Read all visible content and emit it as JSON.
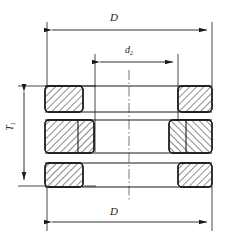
{
  "drawing": {
    "title": "Thrust bearing cross-section",
    "type": "engineering-cross-section",
    "background": "#ffffff",
    "line_color": "#1a1a1a",
    "hatch_color": "#2b2b2b"
  },
  "labels": {
    "outer_diameter_top": "D",
    "outer_diameter_bottom": "D",
    "inner_diameter": "d",
    "inner_diameter_sub": "2",
    "total_height": "T",
    "total_height_sub": "1"
  },
  "dimensions": [
    {
      "name": "D-top",
      "label": "D",
      "orientation": "horizontal",
      "x1": 47,
      "x2": 212,
      "y": 30,
      "arrows": "both"
    },
    {
      "name": "d2",
      "label": "d2",
      "orientation": "horizontal",
      "x1": 95,
      "x2": 178,
      "y": 62,
      "arrows": "both"
    },
    {
      "name": "D-bottom",
      "label": "D",
      "orientation": "horizontal",
      "x1": 47,
      "x2": 212,
      "y": 222,
      "arrows": "both"
    },
    {
      "name": "T1",
      "label": "T1",
      "orientation": "vertical",
      "y1": 86,
      "y2": 186,
      "x": 24,
      "arrows": "both"
    }
  ],
  "rings": [
    {
      "name": "top-left-ring",
      "x": 45,
      "y": 86,
      "w": 38,
      "h": 26,
      "hatch": "right"
    },
    {
      "name": "top-right-ring",
      "x": 178,
      "y": 86,
      "w": 34,
      "h": 26,
      "hatch": "right"
    },
    {
      "name": "middle-left-ring",
      "x": 45,
      "y": 120,
      "w": 49,
      "h": 33,
      "hatch": "right"
    },
    {
      "name": "middle-right-ring",
      "x": 169,
      "y": 120,
      "w": 43,
      "h": 33,
      "hatch": "left"
    },
    {
      "name": "bottom-left-ring",
      "x": 45,
      "y": 163,
      "w": 38,
      "h": 24,
      "hatch": "right"
    },
    {
      "name": "bottom-right-ring",
      "x": 178,
      "y": 163,
      "w": 34,
      "h": 24,
      "hatch": "right"
    }
  ],
  "centerline": {
    "name": "vertical-centerline",
    "x": 129,
    "y1": 70,
    "y2": 200,
    "style": "dash-dot"
  }
}
